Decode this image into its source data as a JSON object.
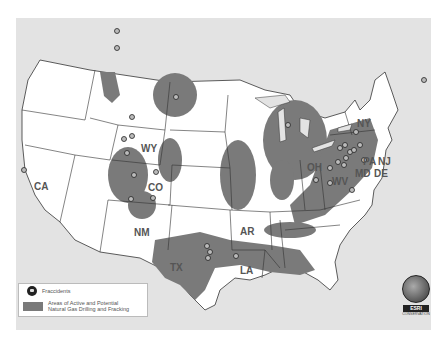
{
  "map": {
    "title": "Fraccidents and Natural Gas Drilling Areas",
    "state_labels": [
      {
        "id": "CA",
        "text": "CA",
        "x": 34,
        "y": 190
      },
      {
        "id": "WY",
        "text": "WY",
        "x": 144,
        "y": 152
      },
      {
        "id": "CO",
        "text": "CO",
        "x": 150,
        "y": 191
      },
      {
        "id": "NM",
        "text": "NM",
        "x": 134,
        "y": 236
      },
      {
        "id": "TX",
        "text": "TX",
        "x": 172,
        "y": 271
      },
      {
        "id": "AR",
        "text": "AR",
        "x": 246,
        "y": 235
      },
      {
        "id": "LA",
        "text": "LA",
        "x": 245,
        "y": 274
      },
      {
        "id": "OH",
        "text": "OH",
        "x": 310,
        "y": 171
      },
      {
        "id": "WV",
        "text": "WV",
        "x": 334,
        "y": 185
      },
      {
        "id": "PA",
        "text": "PA",
        "x": 366,
        "y": 153
      },
      {
        "id": "NJ",
        "text": "NJ",
        "x": 382,
        "y": 157
      },
      {
        "id": "NY",
        "text": "NY",
        "x": 362,
        "y": 125
      },
      {
        "id": "MD",
        "text": "MD",
        "x": 360,
        "y": 174
      },
      {
        "id": "DE",
        "text": "DE",
        "x": 378,
        "y": 174
      }
    ]
  },
  "legend": {
    "fraccidents_label": "Fraccidents",
    "areas_label_line1": "Areas of Active and Potential",
    "areas_label_line2": "Natural Gas Drilling and Fracking",
    "shade_color": "#7a7a7a"
  },
  "logo": {
    "brand": "ESRI",
    "subtext": "CONSERVATION"
  },
  "colors": {
    "land": "#ffffff",
    "background": "#e3e3e3",
    "drilling_area": "#7a7a7a",
    "border": "#333333"
  }
}
